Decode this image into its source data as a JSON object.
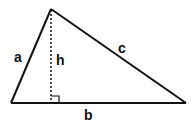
{
  "diagram": {
    "labels": {
      "side_a": "a",
      "side_b": "b",
      "side_c": "c",
      "height": "h"
    },
    "colors": {
      "stroke": "#111111",
      "background": "#ffffff"
    }
  }
}
